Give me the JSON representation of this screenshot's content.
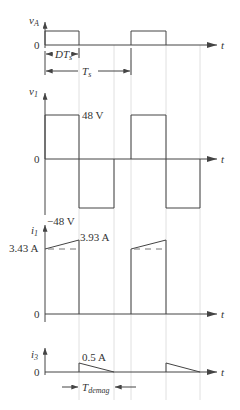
{
  "diagram": {
    "type": "timing-waveforms",
    "time_axis_label": "t",
    "plots": [
      {
        "id": "vA",
        "ylabel": "v",
        "ylabel_sub": "A",
        "zero_label": "0",
        "annotations": {
          "duty_label": "DT",
          "duty_label_sub": "s",
          "period_label": "T",
          "period_label_sub": "s"
        }
      },
      {
        "id": "v1",
        "ylabel": "v",
        "ylabel_sub": "1",
        "zero_label": "0",
        "high_label": "48 V",
        "low_label": "−48 V"
      },
      {
        "id": "i1",
        "ylabel": "i",
        "ylabel_sub": "1",
        "zero_label": "0",
        "start_label": "3.43 A",
        "peak_label": "3.93 A"
      },
      {
        "id": "i3",
        "ylabel": "i",
        "ylabel_sub": "3",
        "zero_label": "0",
        "peak_label": "0.5 A",
        "annotations": {
          "demag_label": "T",
          "demag_label_sub": "demag"
        }
      }
    ]
  }
}
